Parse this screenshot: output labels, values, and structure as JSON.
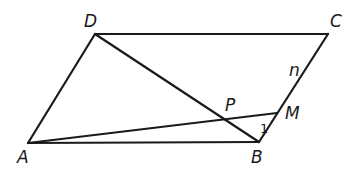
{
  "diagram": {
    "type": "geometry",
    "points": {
      "A": {
        "label": "A",
        "x": 28,
        "y": 143,
        "label_x": 17,
        "label_y": 163
      },
      "B": {
        "label": "B",
        "x": 259,
        "y": 142,
        "label_x": 251,
        "label_y": 163
      },
      "C": {
        "label": "C",
        "x": 328,
        "y": 34,
        "label_x": 330,
        "label_y": 27
      },
      "D": {
        "label": "D",
        "x": 95,
        "y": 34,
        "label_x": 84,
        "label_y": 27
      },
      "M": {
        "label": "M",
        "x": 277,
        "y": 113,
        "label_x": 285,
        "label_y": 119
      },
      "P": {
        "label": "P",
        "x": 222,
        "y": 119,
        "label_x": 225,
        "label_y": 111
      }
    },
    "segments": [
      {
        "name": "AB",
        "from": "A",
        "to": "B"
      },
      {
        "name": "BC",
        "from": "B",
        "to": "C"
      },
      {
        "name": "CD",
        "from": "C",
        "to": "D"
      },
      {
        "name": "DA",
        "from": "D",
        "to": "A"
      },
      {
        "name": "DB",
        "from": "D",
        "to": "B"
      },
      {
        "name": "AM",
        "from": "A",
        "to": "M"
      }
    ],
    "annotations": {
      "side_n": {
        "text": "n",
        "x": 289,
        "y": 76
      },
      "angle_1": {
        "text": "1",
        "x": 260,
        "y": 133
      }
    }
  }
}
